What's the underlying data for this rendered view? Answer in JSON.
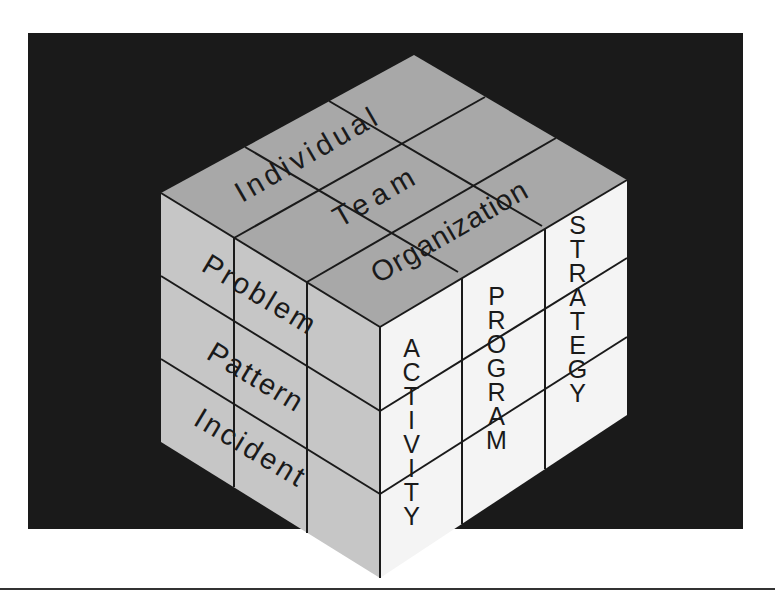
{
  "diagram": {
    "type": "isometric-cube",
    "background_color": "#1a1a1a",
    "colors": {
      "top_face": "#a8a8a8",
      "left_face": "#c4c4c4",
      "right_face": "#f5f5f5",
      "grid_lines": "#1a1a1a"
    },
    "top_face": {
      "axis_name": "scope",
      "labels": [
        "Individual",
        "Team",
        "Organization"
      ]
    },
    "left_face": {
      "axis_name": "level",
      "labels": [
        "Problem",
        "Pattern",
        "Incident"
      ]
    },
    "right_face": {
      "axis_name": "horizon",
      "labels": [
        "ACTIVITY",
        "PROGRAM",
        "STRATEGY"
      ]
    },
    "grid": "3x3x3"
  }
}
